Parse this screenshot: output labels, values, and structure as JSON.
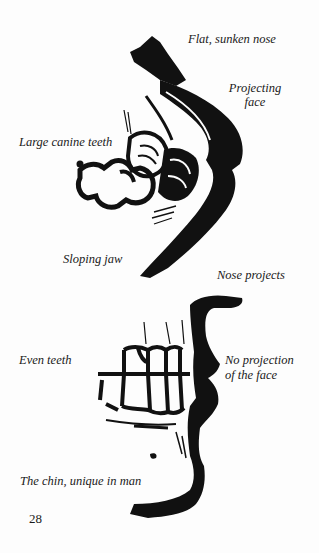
{
  "figure_top": {
    "subject": "ape-skull-profile",
    "labels": {
      "nose": "Flat, sunken nose",
      "face_line1": "Projecting",
      "face_line2": "face",
      "canine": "Large canine teeth",
      "jaw": "Sloping jaw"
    }
  },
  "figure_bottom": {
    "subject": "human-skull-profile",
    "labels": {
      "nose": "Nose projects",
      "teeth": "Even teeth",
      "face_line1": "No projection",
      "face_line2": "of the face",
      "chin": "The chin, unique in man"
    }
  },
  "page_number": "28",
  "colors": {
    "ink": "#111111",
    "paper": "#fdfdfd"
  }
}
